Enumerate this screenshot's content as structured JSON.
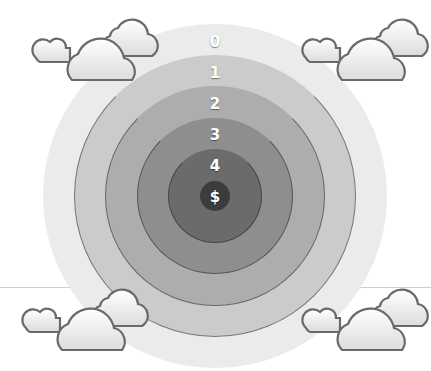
{
  "diagram": {
    "center": {
      "x": 215,
      "y": 196
    },
    "rings": [
      {
        "label": "0",
        "radius": 172,
        "color": "#ebebeb",
        "label_y": 42
      },
      {
        "label": "1",
        "radius": 141,
        "color": "#cbcbcb",
        "label_y": 73
      },
      {
        "label": "2",
        "radius": 110,
        "color": "#adadad",
        "label_y": 104
      },
      {
        "label": "3",
        "radius": 78,
        "color": "#8e8e8e",
        "label_y": 135
      },
      {
        "label": "4",
        "radius": 47,
        "color": "#6b6b6b",
        "label_y": 166
      },
      {
        "label": "$",
        "radius": 15,
        "color": "#3c3c3c",
        "label_y": 197
      }
    ],
    "clouds": [
      "top-left",
      "top-right",
      "bottom-left",
      "bottom-right"
    ]
  }
}
